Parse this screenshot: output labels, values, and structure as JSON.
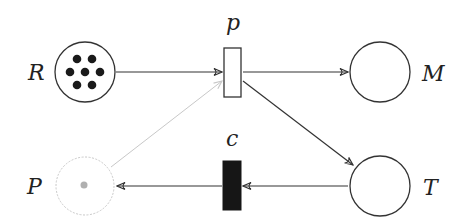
{
  "diagram": {
    "type": "petri-net",
    "places": [
      {
        "id": "R",
        "label": "R",
        "tokens": 7,
        "style": "normal"
      },
      {
        "id": "M",
        "label": "M",
        "tokens": 0,
        "style": "normal"
      },
      {
        "id": "T",
        "label": "T",
        "tokens": 0,
        "style": "normal"
      },
      {
        "id": "P",
        "label": "P",
        "tokens": 1,
        "style": "faded"
      }
    ],
    "transitions": [
      {
        "id": "p",
        "label": "p",
        "fill": "white"
      },
      {
        "id": "c",
        "label": "c",
        "fill": "black"
      }
    ],
    "arcs": [
      {
        "from": "R",
        "to": "p"
      },
      {
        "from": "p",
        "to": "M"
      },
      {
        "from": "p",
        "to": "T"
      },
      {
        "from": "P",
        "to": "p",
        "style": "faded"
      },
      {
        "from": "T",
        "to": "c"
      },
      {
        "from": "c",
        "to": "P"
      }
    ],
    "colors": {
      "stroke": "#333333",
      "faded": "#c8c8c8",
      "token": "#1a1a1a",
      "faded_token": "#b0b0b0"
    }
  }
}
